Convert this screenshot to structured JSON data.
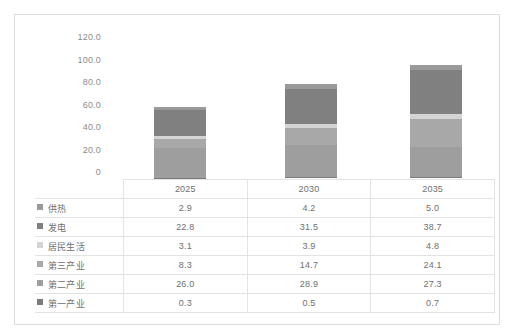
{
  "chart_data": {
    "type": "bar",
    "subtype": "stacked-bar-with-data-table",
    "title": "",
    "xlabel": "",
    "ylabel": "",
    "categories": [
      "2025",
      "2030",
      "2035"
    ],
    "ylim": [
      0,
      120
    ],
    "yticks": [
      "0",
      "20.0",
      "40.0",
      "60.0",
      "80.0",
      "100.0",
      "120.0"
    ],
    "ytick_values": [
      0,
      20,
      40,
      60,
      80,
      100,
      120
    ],
    "grid": false,
    "legend_position": "table-left-column",
    "stack_order_bottom_to_top": [
      "第一产业",
      "第二产业",
      "第三产业",
      "居民生活",
      "发电",
      "供热"
    ],
    "series": [
      {
        "name": "供热",
        "values": [
          2.9,
          4.2,
          5.0
        ],
        "color": "#9a9a9a"
      },
      {
        "name": "发电",
        "values": [
          22.8,
          31.5,
          38.7
        ],
        "color": "#808080"
      },
      {
        "name": "居民生活",
        "values": [
          3.1,
          3.9,
          4.8
        ],
        "color": "#d4d4d4"
      },
      {
        "name": "第三产业",
        "values": [
          8.3,
          14.7,
          24.1
        ],
        "color": "#a8a8a8"
      },
      {
        "name": "第二产业",
        "values": [
          26.0,
          28.9,
          27.3
        ],
        "color": "#9e9e9e"
      },
      {
        "name": "第一产业",
        "values": [
          0.3,
          0.5,
          0.7
        ],
        "color": "#7a7a7a"
      }
    ],
    "totals": [
      63.4,
      83.7,
      100.6
    ]
  },
  "table": {
    "corner": "",
    "headers": [
      "2025",
      "2030",
      "2035"
    ],
    "rows": [
      {
        "label": "供热",
        "cells": [
          "2.9",
          "4.2",
          "5.0"
        ]
      },
      {
        "label": "发电",
        "cells": [
          "22.8",
          "31.5",
          "38.7"
        ]
      },
      {
        "label": "居民生活",
        "cells": [
          "3.1",
          "3.9",
          "4.8"
        ]
      },
      {
        "label": "第三产业",
        "cells": [
          "8.3",
          "14.7",
          "24.1"
        ]
      },
      {
        "label": "第二产业",
        "cells": [
          "26.0",
          "28.9",
          "27.3"
        ]
      },
      {
        "label": "第一产业",
        "cells": [
          "0.3",
          "0.5",
          "0.7"
        ]
      }
    ]
  },
  "colors": {
    "frame_border": "#dcdcdc",
    "grid_line": "#e3e3e3",
    "text": "#6f6f6f",
    "axis_text": "#8d8d8d",
    "background": "#ffffff"
  }
}
